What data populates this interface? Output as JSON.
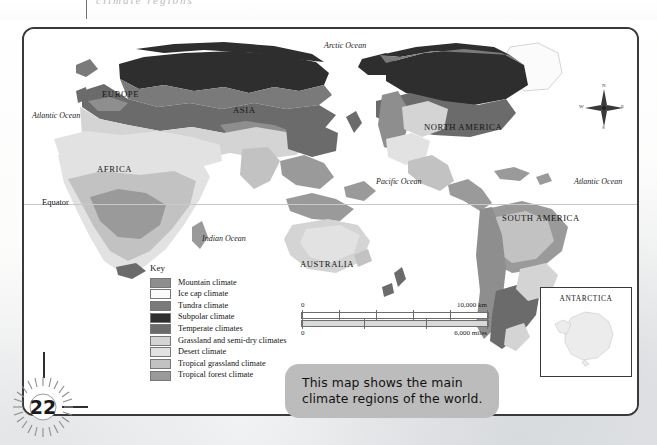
{
  "page": {
    "number": "22",
    "crop_ghost": "climate regions"
  },
  "map": {
    "continents": [
      {
        "name": "EUROPE",
        "x": 78,
        "y": 60
      },
      {
        "name": "ASIA",
        "x": 209,
        "y": 76
      },
      {
        "name": "AFRICA",
        "x": 73,
        "y": 135
      },
      {
        "name": "AUSTRALIA",
        "x": 276,
        "y": 230
      },
      {
        "name": "NORTH AMERICA",
        "x": 400,
        "y": 93
      },
      {
        "name": "SOUTH AMERICA",
        "x": 478,
        "y": 184
      }
    ],
    "oceans": [
      {
        "name": "Arctic Ocean",
        "x": 300,
        "y": 12
      },
      {
        "name": "Atlantic Ocean",
        "x": 8,
        "y": 82
      },
      {
        "name": "Pacific Ocean",
        "x": 352,
        "y": 148
      },
      {
        "name": "Atlantic Ocean",
        "x": 550,
        "y": 148
      },
      {
        "name": "Indian Ocean",
        "x": 178,
        "y": 205
      }
    ],
    "equator_label": "Equator",
    "compass": {
      "north": "N",
      "south": "S",
      "east": "E",
      "west": "W"
    }
  },
  "key": {
    "title": "Key",
    "items": [
      {
        "label": "Mountain climate",
        "color": "#8e8e8e"
      },
      {
        "label": "Ice cap climate",
        "color": "#fbfbfb"
      },
      {
        "label": "Tundra climate",
        "color": "#7a7a7a"
      },
      {
        "label": "Subpolar climate",
        "color": "#2e2e2e"
      },
      {
        "label": "Temperate climates",
        "color": "#6b6b6b"
      },
      {
        "label": "Grassland and semi-dry climates",
        "color": "#d4d4d4"
      },
      {
        "label": "Desert climate",
        "color": "#e2e2e2"
      },
      {
        "label": "Tropical grassland climate",
        "color": "#c2c2c2"
      },
      {
        "label": "Tropical forest climate",
        "color": "#9a9a9a"
      }
    ]
  },
  "scale": {
    "km_start": "0",
    "km_end": "10,000 km",
    "miles_start": "0",
    "miles_end": "6,000 miles"
  },
  "inset": {
    "title": "ANTARCTICA"
  },
  "caption": {
    "line1": "This map shows the main",
    "line2": "climate regions of the world."
  }
}
